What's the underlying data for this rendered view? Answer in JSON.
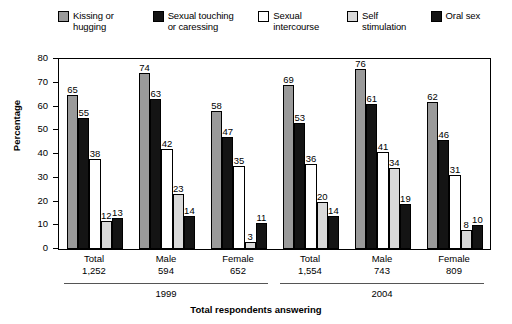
{
  "chart_data": {
    "type": "bar",
    "title": "",
    "xlabel": "Total respondents answering",
    "ylabel": "Percentage",
    "ylim": [
      0,
      80
    ],
    "yticks": [
      0,
      10,
      20,
      30,
      40,
      50,
      60,
      70,
      80
    ],
    "grid": false,
    "legend_position": "top",
    "categories": [
      "Total\n1,252",
      "Male\n594",
      "Female\n652",
      "Total\n1,554",
      "Male\n743",
      "Female\n809"
    ],
    "group_labels": [
      {
        "cat": "Total",
        "num": "1,252"
      },
      {
        "cat": "Male",
        "num": "594"
      },
      {
        "cat": "Female",
        "num": "652"
      },
      {
        "cat": "Total",
        "num": "1,554"
      },
      {
        "cat": "Male",
        "num": "743"
      },
      {
        "cat": "Female",
        "num": "809"
      }
    ],
    "eras": [
      {
        "label": "1999",
        "groups": [
          0,
          1,
          2
        ]
      },
      {
        "label": "2004",
        "groups": [
          3,
          4,
          5
        ]
      }
    ],
    "series": [
      {
        "name": "Kissing or\nhugging",
        "color": "#9a9a9a",
        "border": "#000000",
        "values": [
          65,
          74,
          58,
          69,
          76,
          62
        ]
      },
      {
        "name": "Sexual touching\nor caressing",
        "color": "#141414",
        "border": "#000000",
        "values": [
          55,
          63,
          47,
          53,
          61,
          46
        ]
      },
      {
        "name": "Sexual\nintercourse",
        "color": "#ffffff",
        "border": "#000000",
        "values": [
          38,
          42,
          35,
          36,
          41,
          31
        ]
      },
      {
        "name": "Self\nstimulation",
        "color": "#d9d9d9",
        "border": "#000000",
        "values": [
          12,
          23,
          3,
          20,
          34,
          8
        ]
      },
      {
        "name": "Oral sex",
        "color": "#141414",
        "border": "#000000",
        "values": [
          13,
          14,
          11,
          14,
          19,
          10
        ]
      }
    ]
  }
}
